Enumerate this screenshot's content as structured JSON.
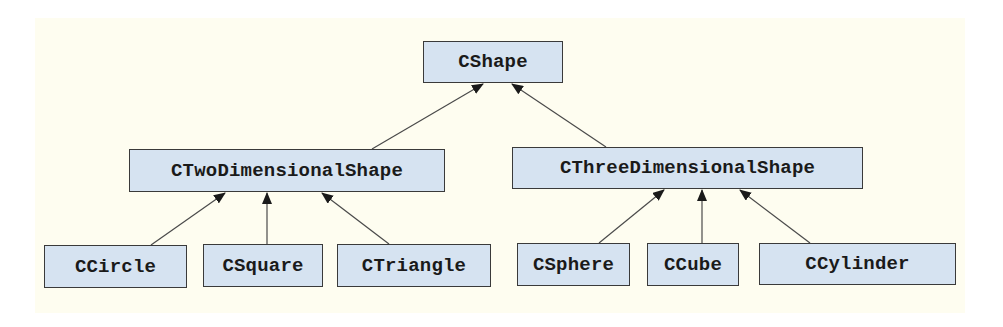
{
  "diagram": {
    "type": "class-inheritance-hierarchy",
    "colors": {
      "background_panel": "#fefdf0",
      "node_fill": "#d6e3f1",
      "node_border": "#3a3a3a",
      "edge": "#3a3a3a",
      "text": "#1a1a1a"
    },
    "nodes": {
      "cshape": {
        "label": "CShape",
        "level": 0
      },
      "ctwo": {
        "label": "CTwoDimensionalShape",
        "level": 1,
        "parent": "CShape"
      },
      "cthree": {
        "label": "CThreeDimensionalShape",
        "level": 1,
        "parent": "CShape"
      },
      "ccircle": {
        "label": "CCircle",
        "level": 2,
        "parent": "CTwoDimensionalShape"
      },
      "csquare": {
        "label": "CSquare",
        "level": 2,
        "parent": "CTwoDimensionalShape"
      },
      "ctriangle": {
        "label": "CTriangle",
        "level": 2,
        "parent": "CTwoDimensionalShape"
      },
      "csphere": {
        "label": "CSphere",
        "level": 2,
        "parent": "CThreeDimensionalShape"
      },
      "ccube": {
        "label": "CCube",
        "level": 2,
        "parent": "CThreeDimensionalShape"
      },
      "ccylinder": {
        "label": "CCylinder",
        "level": 2,
        "parent": "CThreeDimensionalShape"
      }
    },
    "edges": [
      {
        "from": "CTwoDimensionalShape",
        "to": "CShape",
        "arrow": "filled-triangle"
      },
      {
        "from": "CThreeDimensionalShape",
        "to": "CShape",
        "arrow": "filled-triangle"
      },
      {
        "from": "CCircle",
        "to": "CTwoDimensionalShape",
        "arrow": "filled-triangle"
      },
      {
        "from": "CSquare",
        "to": "CTwoDimensionalShape",
        "arrow": "filled-triangle"
      },
      {
        "from": "CTriangle",
        "to": "CTwoDimensionalShape",
        "arrow": "filled-triangle"
      },
      {
        "from": "CSphere",
        "to": "CThreeDimensionalShape",
        "arrow": "filled-triangle"
      },
      {
        "from": "CCube",
        "to": "CThreeDimensionalShape",
        "arrow": "filled-triangle"
      },
      {
        "from": "CCylinder",
        "to": "CThreeDimensionalShape",
        "arrow": "filled-triangle"
      }
    ]
  }
}
